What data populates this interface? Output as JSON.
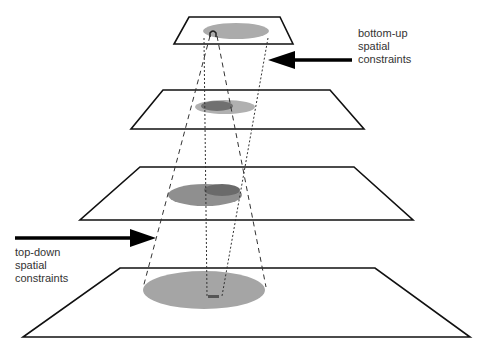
{
  "diagram": {
    "type": "pyramid-of-planes",
    "levels": 4,
    "labels": {
      "bottom_up": [
        "bottom-up",
        "spatial",
        "constraints"
      ],
      "top_down": [
        "top-down",
        "spatial",
        "constraints"
      ]
    },
    "colors": {
      "plane_stroke": "#111111",
      "plane_fill": "#ffffff",
      "region_light": "#a9a9a9",
      "region_dark": "#6e6e6e",
      "arrow": "#000000",
      "text": "#333333"
    }
  }
}
